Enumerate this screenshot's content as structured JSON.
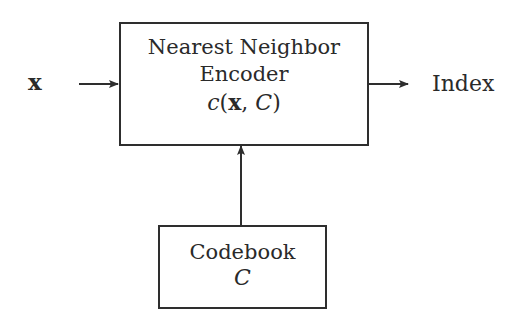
{
  "diagram": {
    "input": {
      "label": "x"
    },
    "encoder": {
      "line1": "Nearest Neighbor",
      "line2": "Encoder",
      "func_name": "c",
      "func_open": "(",
      "func_arg1": "x",
      "func_sep": ", ",
      "func_arg2": "C",
      "func_close": ")"
    },
    "output": {
      "label": "Index"
    },
    "codebook": {
      "line1": "Codebook",
      "symbol": "C"
    },
    "edges": [
      {
        "from": "x",
        "to": "encoder"
      },
      {
        "from": "encoder",
        "to": "Index"
      },
      {
        "from": "codebook",
        "to": "encoder"
      }
    ]
  }
}
